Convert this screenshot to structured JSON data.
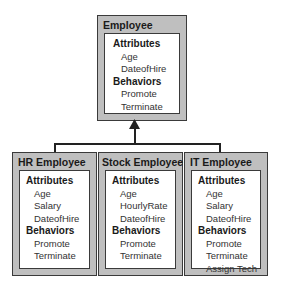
{
  "diagram": {
    "parent": {
      "name": "Employee",
      "attributes_label": "Attributes",
      "attributes": [
        "Age",
        "DateofHire"
      ],
      "behaviors_label": "Behaviors",
      "behaviors": [
        "Promote",
        "Terminate"
      ]
    },
    "children": [
      {
        "name": "HR Employee",
        "attributes_label": "Attributes",
        "attributes": [
          "Age",
          "Salary",
          "DateofHire"
        ],
        "behaviors_label": "Behaviors",
        "behaviors": [
          "Promote",
          "Terminate"
        ]
      },
      {
        "name": "Stock Employee",
        "attributes_label": "Attributes",
        "attributes": [
          "Age",
          "HourlyRate",
          "DateofHire"
        ],
        "behaviors_label": "Behaviors",
        "behaviors": [
          "Promote",
          "Terminate"
        ]
      },
      {
        "name": "IT Employee",
        "attributes_label": "Attributes",
        "attributes": [
          "Age",
          "Salary",
          "DateofHire"
        ],
        "behaviors_label": "Behaviors",
        "behaviors": [
          "Promote",
          "Terminate",
          "Assign Tech"
        ]
      }
    ],
    "relationship": "inheritance"
  }
}
